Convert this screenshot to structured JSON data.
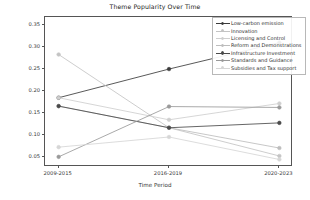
{
  "chart_data": {
    "type": "line",
    "title": "Theme Popularity Over Time",
    "xlabel": "Time Period",
    "ylabel": "Popularity",
    "categories": [
      "2009-2015",
      "2016-2019",
      "2020-2023"
    ],
    "xticklabels": [
      "2009-2015",
      "2016-2019",
      "2020-2023"
    ],
    "yticklabels": [
      "0.05",
      "0.10",
      "0.15",
      "0.20",
      "0.25",
      "0.30",
      "0.35"
    ],
    "yticks": [
      0.05,
      0.1,
      0.15,
      0.2,
      0.25,
      0.3,
      0.35
    ],
    "ylim": [
      0.028,
      0.368
    ],
    "grid": false,
    "legend_position": "upper right",
    "marker": "circle",
    "series": [
      {
        "name": "Low-carbon emission",
        "color": "#3b3b3b",
        "values": [
          0.185,
          0.25,
          0.31
        ]
      },
      {
        "name": "Innovation",
        "color": "#c4c4c4",
        "values": [
          0.283,
          0.117,
          0.053
        ]
      },
      {
        "name": "Licensing and Control",
        "color": "#cfcfcf",
        "values": [
          0.185,
          0.135,
          0.172
        ]
      },
      {
        "name": "Reform and Demonstrations",
        "color": "#bdbdbd",
        "values": [
          0.166,
          0.117,
          0.071
        ]
      },
      {
        "name": "Infrastructure Investment",
        "color": "#4a4a4a",
        "values": [
          0.166,
          0.117,
          0.128
        ]
      },
      {
        "name": "Standards and Guidance",
        "color": "#9a9a9a",
        "values": [
          0.051,
          0.165,
          0.163
        ]
      },
      {
        "name": "Subsidies and Tax support",
        "color": "#d6d6d6",
        "values": [
          0.073,
          0.096,
          0.045
        ]
      }
    ]
  }
}
